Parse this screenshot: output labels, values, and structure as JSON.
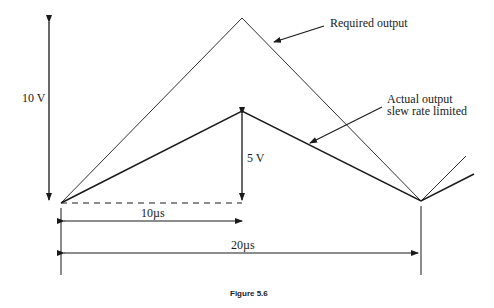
{
  "diagram": {
    "labels": {
      "required_output": "Required output",
      "actual_output_line1": "Actual output",
      "actual_output_line2": "slew rate limited",
      "amplitude_required": "10 V",
      "amplitude_actual": "5 V",
      "half_period": "10µs",
      "full_period": "20µs"
    },
    "caption": "Figure 5.6",
    "colors": {
      "line": "#1a1a1a",
      "background": "#ffffff"
    }
  }
}
